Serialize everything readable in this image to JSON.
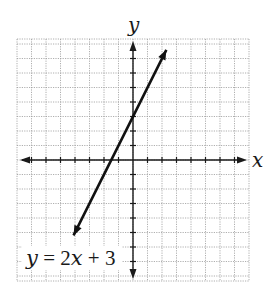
{
  "chart_data": {
    "type": "line",
    "title": "",
    "xlabel": "x",
    "ylabel": "y",
    "xlim": [
      -8,
      8
    ],
    "ylim": [
      -8,
      8
    ],
    "grid": true,
    "grid_step": 1,
    "series": [
      {
        "name": "y = 2x + 3",
        "slope": 2,
        "intercept": 3,
        "x": [
          -4.1,
          2.3
        ],
        "y": [
          -5.2,
          7.6
        ],
        "arrows": "both"
      }
    ],
    "annotations": [
      {
        "text": "y = 2x + 3",
        "position": "lower-left"
      }
    ]
  },
  "labels": {
    "x_axis": "x",
    "y_axis": "y",
    "equation": {
      "y": "y",
      "eq": " = 2",
      "x": "x",
      "rest": " + 3"
    }
  },
  "colors": {
    "grid": "#9a9a9a",
    "axis": "#1a1a1a",
    "line": "#111111",
    "background": "#ffffff"
  }
}
